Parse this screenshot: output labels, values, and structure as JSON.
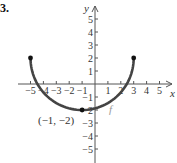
{
  "problem_number": "3.",
  "chart_data": {
    "type": "line",
    "title": "",
    "xlabel": "x",
    "ylabel": "y",
    "xlim": [
      -5.5,
      5.8
    ],
    "ylim": [
      -5.8,
      5.8
    ],
    "grid": false,
    "x_ticks": [
      -5,
      -4,
      -3,
      -2,
      -1,
      1,
      2,
      3,
      4,
      5
    ],
    "y_ticks": [
      -5,
      -4,
      -3,
      -2,
      -1,
      1,
      2,
      3,
      4,
      5
    ],
    "x_tick_labels": [
      "−5",
      "−4",
      "−3",
      "−2",
      "−1",
      "1",
      "2",
      "3",
      "4",
      "5"
    ],
    "y_tick_labels": [
      "−5",
      "−4",
      "−3",
      "−2",
      "−1",
      "1",
      "2",
      "3",
      "4",
      "5"
    ],
    "series": [
      {
        "name": "f",
        "description": "lower semicircle centered at (-1, 2) with radius 4",
        "center": [
          -1,
          2
        ],
        "radius": 4,
        "x": [
          -5,
          -4.5,
          -4,
          -3.5,
          -3,
          -2.5,
          -2,
          -1.5,
          -1,
          -0.5,
          0,
          0.5,
          1,
          1.5,
          2,
          2.5,
          3
        ],
        "y": [
          2,
          0.06,
          -0.65,
          -1.12,
          -1.46,
          -1.71,
          -1.87,
          -1.97,
          -2,
          -1.97,
          -1.87,
          -1.71,
          -1.46,
          -1.12,
          -0.65,
          0.06,
          2
        ],
        "color": "#444444"
      }
    ],
    "points": [
      {
        "x": -5,
        "y": 2,
        "label": "",
        "filled": true
      },
      {
        "x": 3,
        "y": 2,
        "label": "",
        "filled": true
      },
      {
        "x": -1,
        "y": -2,
        "label": "(−1, −2)",
        "filled": true
      }
    ],
    "annotations": [
      {
        "text": "f",
        "x": 1.3,
        "y": -1.8
      },
      {
        "text": "(−1, −2)",
        "x": -2.5,
        "y": -2.5
      }
    ]
  }
}
